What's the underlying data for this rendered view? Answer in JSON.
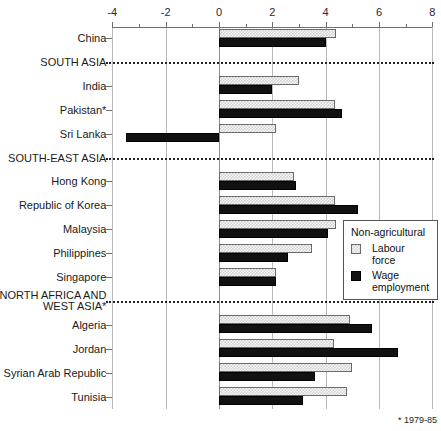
{
  "chart_data": {
    "type": "bar",
    "orientation": "horizontal",
    "title": "",
    "xlabel": "",
    "ylabel": "",
    "xlim": [
      -4,
      8
    ],
    "xticks": [
      -4,
      -2,
      0,
      2,
      4,
      6,
      8
    ],
    "xticklabels": [
      "-4",
      "-2",
      "0",
      "2",
      "4",
      "6",
      "8"
    ],
    "minor_tick_step": 1,
    "grid": true,
    "legend": {
      "position": "center-right",
      "title": "Non-agricultural",
      "entries": [
        {
          "name": "Labour force",
          "swatch": "light-dotted"
        },
        {
          "name": "Wage employment",
          "swatch": "solid-black"
        }
      ]
    },
    "series": [
      {
        "name": "Labour force",
        "key": "lf"
      },
      {
        "name": "Wage employment",
        "key": "we"
      }
    ],
    "categories": [
      {
        "label": "China",
        "type": "country",
        "lf": 4.4,
        "we": 4.0
      },
      {
        "label": "SOUTH ASIA",
        "type": "region",
        "lf": null,
        "we": null
      },
      {
        "label": "India",
        "type": "country",
        "lf": 3.0,
        "we": 2.0
      },
      {
        "label": "Pakistan*",
        "type": "country",
        "lf": 4.35,
        "we": 4.6
      },
      {
        "label": "Sri Lanka",
        "type": "country",
        "lf": 2.15,
        "we": -3.5
      },
      {
        "label": "SOUTH-EAST ASIA",
        "type": "region",
        "lf": null,
        "we": null
      },
      {
        "label": "Hong Kong",
        "type": "country",
        "lf": 2.8,
        "we": 2.9
      },
      {
        "label": "Republic of Korea",
        "type": "country",
        "lf": 4.35,
        "we": 5.2
      },
      {
        "label": "Malaysia",
        "type": "country",
        "lf": 4.4,
        "we": 4.1
      },
      {
        "label": "Philippines",
        "type": "country",
        "lf": 3.5,
        "we": 2.6
      },
      {
        "label": "Singapore",
        "type": "country",
        "lf": 2.15,
        "we": 2.15
      },
      {
        "label": "NORTH AFRICA AND WEST ASIA*",
        "type": "region",
        "lf": null,
        "we": null
      },
      {
        "label": "Algeria",
        "type": "country",
        "lf": 4.9,
        "we": 5.75
      },
      {
        "label": "Jordan",
        "type": "country",
        "lf": 4.3,
        "we": 6.7
      },
      {
        "label": "Syrian Arab Republic",
        "type": "country",
        "lf": 5.0,
        "we": 3.6
      },
      {
        "label": "Tunisia",
        "type": "country",
        "lf": 4.8,
        "we": 3.15
      }
    ],
    "footnote": "*  1979-85"
  }
}
